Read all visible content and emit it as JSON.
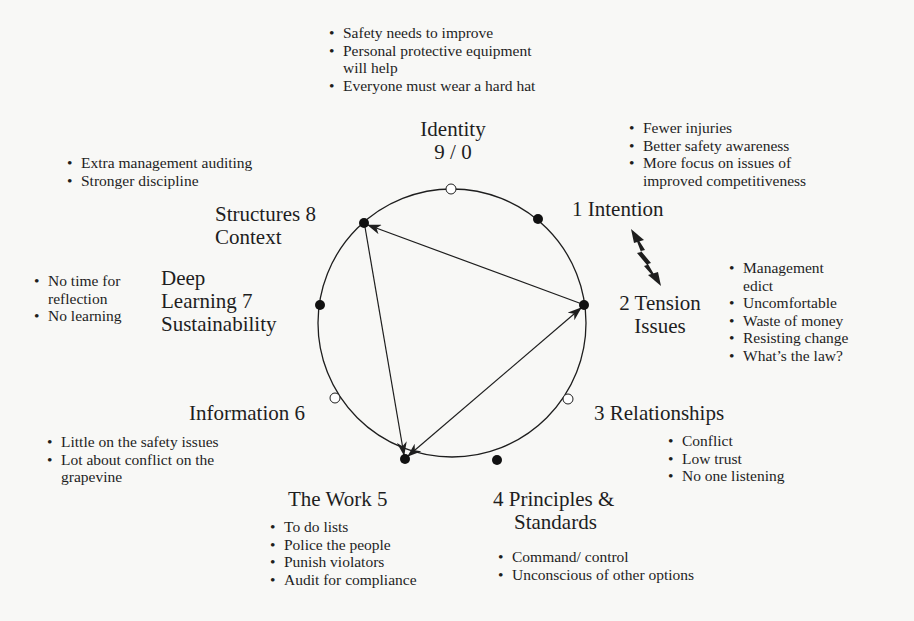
{
  "diagram": {
    "circle": {
      "cx": 452,
      "cy": 323,
      "r": 134
    },
    "nodes": [
      {
        "id": "9/0",
        "x": 451,
        "y": 189,
        "filled": false
      },
      {
        "id": "1",
        "x": 538,
        "y": 219,
        "filled": true
      },
      {
        "id": "2",
        "x": 584,
        "y": 305,
        "filled": true
      },
      {
        "id": "3",
        "x": 568,
        "y": 399,
        "filled": false
      },
      {
        "id": "4",
        "x": 497,
        "y": 460,
        "filled": true
      },
      {
        "id": "5",
        "x": 405,
        "y": 459,
        "filled": true
      },
      {
        "id": "6",
        "x": 335,
        "y": 398,
        "filled": false
      },
      {
        "id": "7",
        "x": 320,
        "y": 305,
        "filled": true
      },
      {
        "id": "8",
        "x": 364,
        "y": 223,
        "filled": true
      }
    ],
    "arrows": [
      {
        "from": "2",
        "to": "8",
        "bidirectional": false
      },
      {
        "from": "8",
        "to": "5",
        "bidirectional": false
      },
      {
        "from": "5",
        "to": "2",
        "bidirectional": true
      }
    ],
    "tension_arrow": {
      "between": [
        "1 Intention",
        "2 Tension"
      ],
      "style": "lightning-double-arrow"
    }
  },
  "labels": {
    "identity": {
      "line1": "Identity",
      "line2": "9 / 0"
    },
    "intention": "1 Intention",
    "tension": {
      "line1": "2 Tension",
      "line2": "Issues"
    },
    "relationships": "3 Relationships",
    "principles": {
      "line1": "4 Principles &",
      "line2": "Standards"
    },
    "work": "The Work 5",
    "information": "Information 6",
    "deep_learning": {
      "line1": "Deep",
      "line2": "Learning 7",
      "line3": "Sustainability"
    },
    "structures": {
      "line1": "Structures 8",
      "line2": "Context"
    }
  },
  "notes": {
    "identity": [
      "Safety needs to improve",
      "Personal protective equipment",
      "will help",
      "Everyone must wear a hard hat"
    ],
    "intention": [
      "Fewer injuries",
      "Better safety awareness",
      "More focus on issues of",
      "improved competitiveness"
    ],
    "tension": [
      "Management",
      "edict",
      "Uncomfortable",
      "Waste of money",
      "Resisting change",
      "What’s the law?"
    ],
    "relationships": [
      "Conflict",
      "Low trust",
      "No one listening"
    ],
    "principles": [
      "Command/ control",
      "Unconscious of other options"
    ],
    "work": [
      "To do lists",
      "Police the people",
      "Punish violators",
      "Audit for compliance"
    ],
    "information": [
      "Little on the safety issues",
      "Lot about conflict on the",
      "grapevine"
    ],
    "deep_learning": [
      "No time for",
      "reflection",
      "No learning"
    ],
    "structures": [
      "Extra management auditing",
      "Stronger discipline"
    ]
  }
}
